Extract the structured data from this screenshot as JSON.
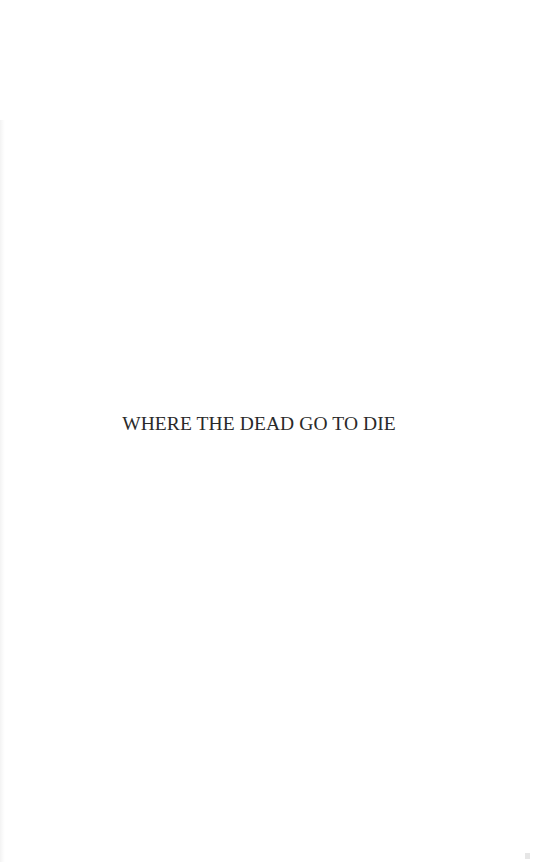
{
  "page": {
    "type": "half-title",
    "title": "WHERE THE DEAD GO TO DIE",
    "colors": {
      "background": "#ffffff",
      "text": "#2a2a2a"
    }
  }
}
